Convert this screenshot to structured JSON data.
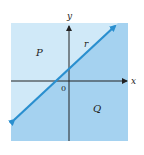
{
  "diagram": {
    "type": "half-plane",
    "axes": {
      "x_label": "x",
      "y_label": "y",
      "origin_label": "0"
    },
    "line": {
      "label": "r",
      "color": "#2a8fcf"
    },
    "regions": [
      {
        "label": "P",
        "position": "above-left of line",
        "color": "#d0e9f8"
      },
      {
        "label": "Q",
        "position": "below-right of line",
        "color": "#a5d2f0"
      }
    ]
  }
}
